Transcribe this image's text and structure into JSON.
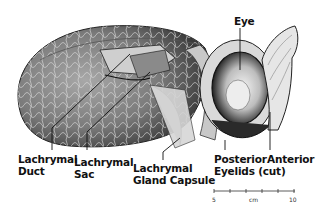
{
  "labels": {
    "eye": "Eye",
    "lachrymal_duct": [
      "Lachrymal",
      "Duct"
    ],
    "lachrymal_sac": [
      "Lachrymal",
      "Sac"
    ],
    "lachrymal_gland_capsule": [
      "Lachrymal",
      "Gland Capsule"
    ],
    "posterior_eyelids": [
      "Posterior",
      "Eyelids (cut)"
    ],
    "anterior": "Anterior"
  },
  "scale_bar": {
    "start": "5",
    "unit": "cm",
    "end": "10",
    "ticks": 6
  }
}
